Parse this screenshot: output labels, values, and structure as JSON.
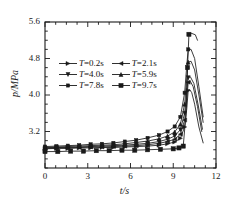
{
  "chart_data": {
    "type": "line",
    "title": "",
    "xlabel": "t/s",
    "ylabel": "p/MPa",
    "xlim": [
      0,
      12
    ],
    "ylim": [
      2.4,
      5.6
    ],
    "xticks": [
      "0",
      "3",
      "6",
      "9",
      "12"
    ],
    "xtick_values": [
      0,
      3,
      6,
      9,
      12
    ],
    "yticks": [
      "3.2",
      "4.0",
      "4.8",
      "5.6"
    ],
    "ytick_values": [
      3.2,
      4.0,
      4.8,
      5.6
    ],
    "minor_ticks": true,
    "grid": false,
    "legend_position": "upper-center-left",
    "frame": "box",
    "line_color": "#1a1a1a",
    "background": "#ffffff",
    "series": [
      {
        "name": "T=0.2s",
        "label_prefix": "T",
        "label_value": "=0.2s",
        "marker": "right-triangle",
        "x": [
          0.0,
          0.8,
          1.6,
          2.4,
          3.2,
          4.0,
          4.8,
          5.6,
          6.4,
          7.2,
          8.0,
          8.6,
          9.1,
          9.5,
          9.8,
          9.95,
          10.05,
          10.15,
          10.3,
          10.5,
          10.8,
          11.1
        ],
        "y": [
          2.82,
          2.83,
          2.83,
          2.84,
          2.84,
          2.85,
          2.85,
          2.86,
          2.87,
          2.88,
          2.9,
          2.93,
          2.97,
          3.05,
          3.3,
          3.7,
          4.1,
          4.12,
          4.05,
          3.8,
          3.3,
          2.95
        ]
      },
      {
        "name": "T=2.1s",
        "label_prefix": "T",
        "label_value": "=2.1s",
        "marker": "left-triangle",
        "x": [
          0.0,
          0.8,
          1.6,
          2.4,
          3.2,
          4.0,
          4.8,
          5.6,
          6.4,
          7.2,
          8.0,
          8.6,
          9.1,
          9.5,
          9.8,
          9.95,
          10.05,
          10.2,
          10.4,
          10.7,
          11.0
        ],
        "y": [
          2.83,
          2.84,
          2.84,
          2.85,
          2.86,
          2.86,
          2.87,
          2.88,
          2.89,
          2.91,
          2.94,
          2.98,
          3.03,
          3.14,
          3.45,
          3.9,
          4.28,
          4.3,
          4.18,
          3.75,
          3.2
        ]
      },
      {
        "name": "T=4.0s",
        "label_prefix": "T",
        "label_value": "=4.0s",
        "marker": "down-triangle",
        "x": [
          0.0,
          0.8,
          1.6,
          2.4,
          3.2,
          4.0,
          4.8,
          5.6,
          6.4,
          7.2,
          8.0,
          8.6,
          9.1,
          9.5,
          9.8,
          9.95,
          10.05,
          10.2,
          10.45,
          10.75,
          11.05
        ],
        "y": [
          2.84,
          2.85,
          2.85,
          2.86,
          2.87,
          2.88,
          2.89,
          2.9,
          2.92,
          2.94,
          2.98,
          3.03,
          3.1,
          3.24,
          3.6,
          4.1,
          4.38,
          4.4,
          4.25,
          3.78,
          3.25
        ]
      },
      {
        "name": "T=5.9s",
        "label_prefix": "T",
        "label_value": "=5.9s",
        "marker": "up-triangle",
        "x": [
          0.0,
          0.8,
          1.6,
          2.4,
          3.2,
          4.0,
          4.8,
          5.6,
          6.4,
          7.2,
          8.0,
          8.6,
          9.1,
          9.5,
          9.8,
          9.95,
          10.05,
          10.25,
          10.5,
          10.8,
          11.1
        ],
        "y": [
          2.85,
          2.86,
          2.87,
          2.88,
          2.89,
          2.9,
          2.91,
          2.93,
          2.96,
          2.99,
          3.04,
          3.1,
          3.19,
          3.36,
          3.8,
          4.35,
          4.72,
          4.74,
          4.55,
          4.0,
          3.4
        ]
      },
      {
        "name": "T=7.8s",
        "label_prefix": "T",
        "label_value": "=7.8s",
        "marker": "square-small",
        "x": [
          0.0,
          0.8,
          1.6,
          2.4,
          3.2,
          4.0,
          4.8,
          5.6,
          6.4,
          7.2,
          8.0,
          8.6,
          9.1,
          9.5,
          9.8,
          9.95,
          10.05,
          10.25,
          10.5,
          10.8,
          11.1
        ],
        "y": [
          2.87,
          2.88,
          2.89,
          2.9,
          2.92,
          2.93,
          2.95,
          2.98,
          3.01,
          3.06,
          3.12,
          3.2,
          3.31,
          3.52,
          4.05,
          4.65,
          5.0,
          5.0,
          4.8,
          4.18,
          3.52
        ]
      },
      {
        "name": "T=9.7s",
        "label_prefix": "T",
        "label_value": "=9.7s",
        "marker": "square",
        "x": [
          0.0,
          0.9,
          1.8,
          2.7,
          3.6,
          4.5,
          5.4,
          6.3,
          7.2,
          8.1,
          9.0,
          9.4,
          9.7,
          9.9,
          10.0,
          10.1,
          10.3,
          10.55,
          10.7
        ],
        "y": [
          2.76,
          2.76,
          2.77,
          2.77,
          2.78,
          2.78,
          2.79,
          2.79,
          2.8,
          2.81,
          2.82,
          2.84,
          2.88,
          3.6,
          4.6,
          5.33,
          5.35,
          5.32,
          5.2
        ]
      }
    ]
  }
}
